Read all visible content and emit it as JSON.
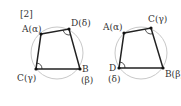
{
  "figure_label": "[2]",
  "colors": {
    "circle": "#c8c8c8",
    "edge": "#222222",
    "vertex": "#111111",
    "text": "#333333",
    "background": "#ffffff"
  },
  "diagrams": [
    {
      "name": "left-quadrilateral",
      "circle": {
        "cx": 57,
        "cy": 53,
        "r": 26
      },
      "vertices": [
        {
          "id": "A",
          "x": 41,
          "y": 34,
          "label": "A(α)",
          "lx": 22,
          "ly": 32
        },
        {
          "id": "D",
          "x": 69,
          "y": 29,
          "label": "D(δ)",
          "lx": 71,
          "ly": 26
        },
        {
          "id": "B",
          "x": 80,
          "y": 69,
          "label": "B",
          "lx": 82,
          "ly": 72,
          "sublabel": "(β)",
          "slx": 81,
          "sly": 83
        },
        {
          "id": "C",
          "x": 36,
          "y": 69,
          "label": "C(γ)",
          "lx": 17,
          "ly": 81
        }
      ],
      "order": [
        "A",
        "D",
        "B",
        "C"
      ],
      "angle_marks": [
        "D",
        "C"
      ]
    },
    {
      "name": "right-quadrilateral",
      "circle": {
        "cx": 141,
        "cy": 53,
        "r": 26
      },
      "vertices": [
        {
          "id": "A",
          "x": 124,
          "y": 33,
          "label": "A(α)",
          "lx": 103,
          "ly": 30
        },
        {
          "id": "C",
          "x": 151,
          "y": 28,
          "label": "C(γ)",
          "lx": 148,
          "ly": 22
        },
        {
          "id": "B",
          "x": 163,
          "y": 68,
          "label": "B(β)",
          "lx": 165,
          "ly": 77
        },
        {
          "id": "D",
          "x": 119,
          "y": 68,
          "label": "D",
          "lx": 109,
          "ly": 71,
          "sublabel": "(δ)",
          "slx": 108,
          "sly": 82
        }
      ],
      "order": [
        "A",
        "C",
        "B",
        "D"
      ],
      "angle_marks": [
        "C",
        "D"
      ]
    }
  ]
}
